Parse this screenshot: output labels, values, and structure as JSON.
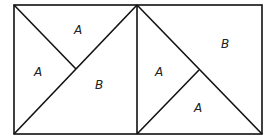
{
  "diagram": {
    "left_square": {
      "labels": [
        {
          "text": "A",
          "region": "top"
        },
        {
          "text": "A",
          "region": "left"
        },
        {
          "text": "B",
          "region": "bottom-right"
        }
      ]
    },
    "right_square": {
      "labels": [
        {
          "text": "B",
          "region": "top-right"
        },
        {
          "text": "A",
          "region": "left"
        },
        {
          "text": "A",
          "region": "bottom"
        }
      ]
    },
    "colors": {
      "stroke": "#111111",
      "background": "#ffffff"
    }
  }
}
